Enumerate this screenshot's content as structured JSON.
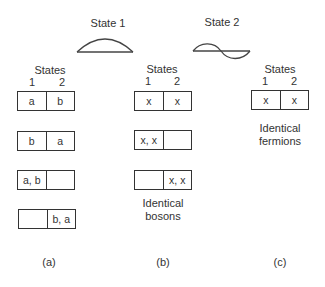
{
  "wavefunctions": [
    {
      "label": "State 1",
      "shape": "half-sine-arc"
    },
    {
      "label": "State 2",
      "shape": "full-sine-wave"
    }
  ],
  "columns": [
    {
      "header": "States",
      "state_numbers": [
        "1",
        "2"
      ],
      "rows": [
        [
          "a",
          "b"
        ],
        [
          "b",
          "a"
        ],
        [
          "a, b",
          ""
        ],
        [
          "",
          "b, a"
        ]
      ],
      "caption": "",
      "panel": "(a)"
    },
    {
      "header": "States",
      "state_numbers": [
        "1",
        "2"
      ],
      "rows": [
        [
          "x",
          "x"
        ],
        [
          "x, x",
          ""
        ],
        [
          "",
          "x, x"
        ]
      ],
      "caption": [
        "Identical",
        "bosons"
      ],
      "panel": "(b)"
    },
    {
      "header": "States",
      "state_numbers": [
        "1",
        "2"
      ],
      "rows": [
        [
          "x",
          "x"
        ]
      ],
      "caption": [
        "Identical",
        "fermions"
      ],
      "panel": "(c)"
    }
  ]
}
